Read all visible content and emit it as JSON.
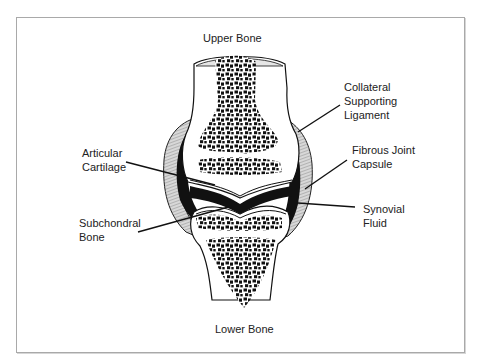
{
  "diagram": {
    "type": "anatomy-joint-cross-section",
    "colors": {
      "ink": "#111111",
      "border": "#a9a9a9",
      "background": "#ffffff",
      "capsule": "#bdbdbd"
    },
    "labels": [
      {
        "id": "upper-bone",
        "text": "Upper Bone",
        "x": 203,
        "y": 31
      },
      {
        "id": "collateral-ligament",
        "text": "Collateral\nSupporting\nLigament",
        "x": 344,
        "y": 80
      },
      {
        "id": "articular-cartilage",
        "text": "Articular\nCartilage",
        "x": 82,
        "y": 146
      },
      {
        "id": "fibrous-capsule",
        "text": "Fibrous Joint\nCapsule",
        "x": 352,
        "y": 143
      },
      {
        "id": "synovial-fluid",
        "text": "Synovial\nFluid",
        "x": 363,
        "y": 202
      },
      {
        "id": "subchondral-bone",
        "text": "Subchondral\nBone",
        "x": 79,
        "y": 216
      },
      {
        "id": "lower-bone",
        "text": "Lower Bone",
        "x": 215,
        "y": 322
      }
    ],
    "leaders": [
      {
        "to": "collateral-ligament",
        "x1": 340,
        "y1": 105,
        "x2": 298,
        "y2": 132
      },
      {
        "to": "articular-cartilage",
        "x1": 126,
        "y1": 162,
        "x2": 215,
        "y2": 185
      },
      {
        "to": "fibrous-capsule",
        "x1": 347,
        "y1": 160,
        "x2": 305,
        "y2": 189
      },
      {
        "to": "synovial-fluid",
        "x1": 355,
        "y1": 207,
        "x2": 298,
        "y2": 203
      },
      {
        "to": "subchondral-bone",
        "x1": 138,
        "y1": 232,
        "x2": 232,
        "y2": 206
      }
    ]
  }
}
